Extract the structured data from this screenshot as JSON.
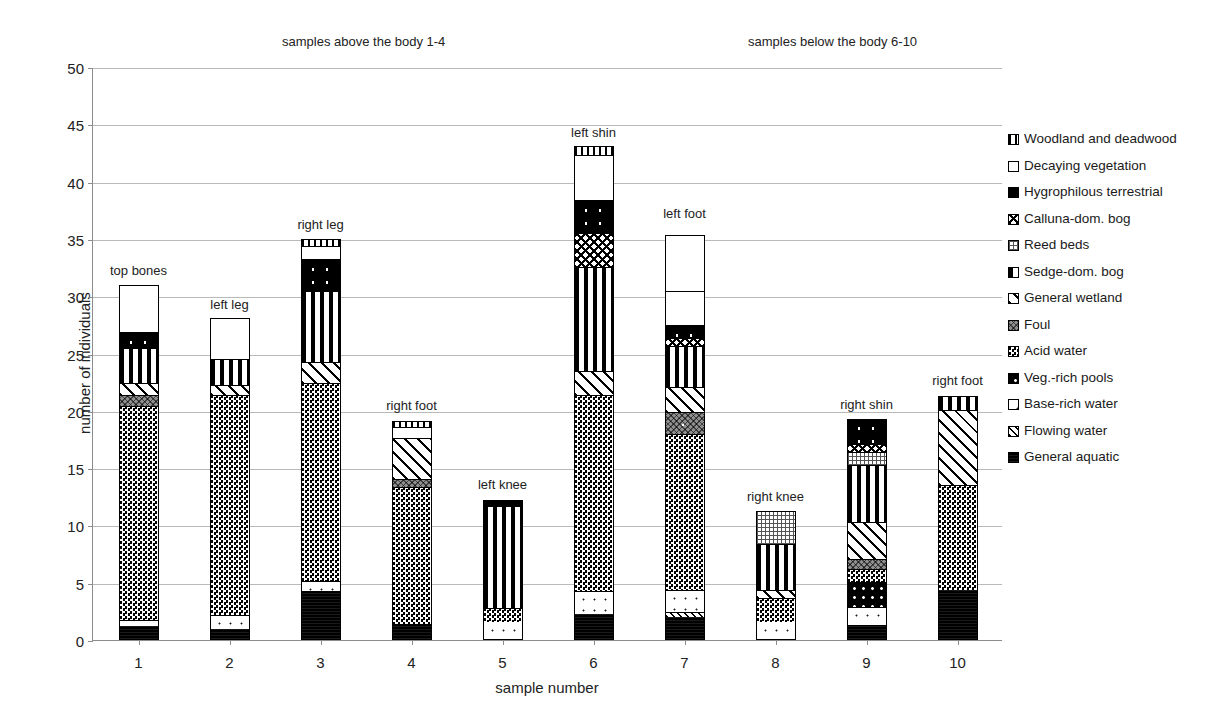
{
  "chart_data": {
    "type": "bar",
    "subtype": "stacked",
    "title": "",
    "xlabel": "sample number",
    "ylabel": "number of individuals",
    "ylim": [
      0,
      50
    ],
    "ytick_step": 5,
    "yticks": [
      0,
      5,
      10,
      15,
      20,
      25,
      30,
      35,
      40,
      45,
      50
    ],
    "grid": true,
    "legend_position": "right",
    "categories": [
      "1",
      "2",
      "3",
      "4",
      "5",
      "6",
      "7",
      "8",
      "9",
      "10"
    ],
    "group_captions": [
      {
        "text": "samples above the body 1-4",
        "x": 282,
        "y": 34
      },
      {
        "text": "samples below the body 6-10",
        "x": 748,
        "y": 34
      }
    ],
    "bar_captions": [
      "top bones",
      "left leg",
      "right leg",
      "right foot",
      "left knee",
      "left shin",
      "left foot",
      "right knee",
      "right shin",
      "right foot"
    ],
    "bar_caption_y_value": [
      33.0,
      30.0,
      37.0,
      21.2,
      14.3,
      45.0,
      38.0,
      13.3,
      21.3,
      23.4
    ],
    "totals": [
      31.0,
      28.1,
      35.0,
      19.1,
      12.2,
      43.1,
      35.3,
      11.3,
      19.3,
      21.3
    ],
    "series": [
      {
        "name": "General aquatic",
        "key": "general-aquatic",
        "values": [
          1.1,
          0.9,
          4.2,
          1.3,
          0.0,
          2.2,
          1.9,
          0.0,
          1.2,
          4.3
        ]
      },
      {
        "name": "Flowing water",
        "key": "flowing-water",
        "values": [
          0.0,
          0.0,
          0.0,
          0.0,
          0.0,
          0.0,
          0.5,
          0.0,
          0.0,
          0.0
        ]
      },
      {
        "name": "Base-rich water",
        "key": "base-rich-water",
        "values": [
          0.6,
          1.2,
          0.9,
          0.0,
          1.5,
          2.0,
          1.9,
          1.5,
          1.6,
          0.0
        ]
      },
      {
        "name": "Veg.-rich pools",
        "key": "veg-rich-pools",
        "values": [
          0.0,
          0.0,
          0.0,
          0.0,
          0.0,
          0.0,
          0.0,
          0.0,
          2.2,
          0.0
        ]
      },
      {
        "name": "Acid water",
        "key": "acid-water",
        "values": [
          18.6,
          19.2,
          17.2,
          12.0,
          1.2,
          17.1,
          13.6,
          2.1,
          1.1,
          9.1
        ]
      },
      {
        "name": "Foul",
        "key": "foul",
        "values": [
          1.0,
          0.0,
          0.0,
          0.7,
          0.0,
          0.0,
          1.9,
          0.0,
          0.9,
          0.0
        ]
      },
      {
        "name": "General wetland",
        "key": "general-wetland",
        "values": [
          1.0,
          0.9,
          1.9,
          3.5,
          0.0,
          2.1,
          2.2,
          0.7,
          3.2,
          6.6
        ]
      },
      {
        "name": "Sedge-dom. bog",
        "key": "sedge-dom-bog",
        "values": [
          3.1,
          2.2,
          6.2,
          0.0,
          8.9,
          9.1,
          3.6,
          4.0,
          5.0,
          1.3
        ]
      },
      {
        "name": "Reed beds",
        "key": "reed-beds",
        "values": [
          0.0,
          0.0,
          0.0,
          0.0,
          0.0,
          0.0,
          0.0,
          3.0,
          1.1,
          0.0
        ]
      },
      {
        "name": "Calluna-dom. bog",
        "key": "calluna-dom-bog",
        "values": [
          0.0,
          0.0,
          0.0,
          0.0,
          0.0,
          2.9,
          0.7,
          0.0,
          0.7,
          0.0
        ]
      },
      {
        "name": "Hygrophilous terrestrial",
        "key": "hygrophilous-terrestrial",
        "values": [
          1.4,
          0.0,
          2.8,
          0.0,
          0.6,
          2.9,
          1.1,
          0.0,
          2.3,
          0.0
        ]
      },
      {
        "name": "Decaying vegetation",
        "key": "decaying-vegetation",
        "values": [
          4.3,
          3.7,
          1.1,
          1.0,
          0.0,
          3.9,
          3.0,
          0.0,
          0.0,
          0.0
        ]
      },
      {
        "name": "Woodland and deadwood",
        "key": "woodland-and-deadwood",
        "values": [
          0.9,
          0.0,
          0.7,
          0.6,
          0.0,
          0.9,
          0.0,
          0.0,
          0.0,
          0.0
        ]
      }
    ]
  },
  "legend": {
    "items": [
      {
        "label": "Woodland and deadwood",
        "key": "woodland-and-deadwood"
      },
      {
        "label": "Decaying vegetation",
        "key": "decaying-vegetation"
      },
      {
        "label": "Hygrophilous terrestrial",
        "key": "hygrophilous-terrestrial"
      },
      {
        "label": "Calluna-dom. bog",
        "key": "calluna-dom-bog"
      },
      {
        "label": "Reed beds",
        "key": "reed-beds"
      },
      {
        "label": "Sedge-dom. bog",
        "key": "sedge-dom-bog"
      },
      {
        "label": "General wetland",
        "key": "general-wetland"
      },
      {
        "label": "Foul",
        "key": "foul"
      },
      {
        "label": "Acid water",
        "key": "acid-water"
      },
      {
        "label": "Veg.-rich pools",
        "key": "veg-rich-pools"
      },
      {
        "label": "Base-rich water",
        "key": "base-rich-water"
      },
      {
        "label": "Flowing water",
        "key": "flowing-water"
      },
      {
        "label": "General aquatic",
        "key": "general-aquatic"
      }
    ]
  }
}
